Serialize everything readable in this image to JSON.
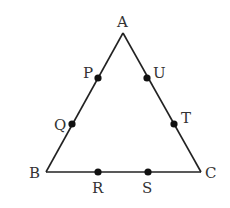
{
  "diagram": {
    "type": "triangle",
    "stroke_color": "#222222",
    "vertices": [
      {
        "name": "A",
        "x": 123,
        "y": 33
      },
      {
        "name": "B",
        "x": 46,
        "y": 172
      },
      {
        "name": "C",
        "x": 201,
        "y": 172
      }
    ],
    "points": [
      {
        "name": "P",
        "x": 98,
        "y": 78,
        "on": "AB"
      },
      {
        "name": "Q",
        "x": 72,
        "y": 124,
        "on": "AB"
      },
      {
        "name": "R",
        "x": 98,
        "y": 172,
        "on": "BC"
      },
      {
        "name": "S",
        "x": 148,
        "y": 172,
        "on": "BC"
      },
      {
        "name": "T",
        "x": 174,
        "y": 124,
        "on": "CA"
      },
      {
        "name": "U",
        "x": 147,
        "y": 78,
        "on": "CA"
      }
    ],
    "labels": {
      "A": "A",
      "B": "B",
      "C": "C",
      "P": "P",
      "Q": "Q",
      "R": "R",
      "S": "S",
      "T": "T",
      "U": "U"
    }
  }
}
